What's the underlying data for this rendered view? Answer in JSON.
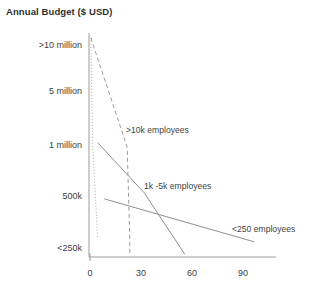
{
  "chart_data": {
    "type": "line",
    "title": "Annual Budget ($ USD)",
    "xlabel": "",
    "ylabel": "Annual Budget ($ USD)",
    "grid": false,
    "legend_position": "inline-annotations",
    "x_ticks": [
      {
        "label": "0",
        "value": 0
      },
      {
        "label": "30",
        "value": 30
      },
      {
        "label": "60",
        "value": 60
      },
      {
        "label": "90",
        "value": 90
      }
    ],
    "xlim": [
      0,
      110
    ],
    "y_ticks": [
      {
        "label": ">10 million",
        "value": 5
      },
      {
        "label": "5 million",
        "value": 4
      },
      {
        "label": "1 million",
        "value": 3
      },
      {
        "label": "500k",
        "value": 2
      },
      {
        "label": "<250k",
        "value": 1
      }
    ],
    "ylim": [
      0.6,
      5.3
    ],
    "series": [
      {
        "name": "more-than-10k-left",
        "label": "",
        "style": "dotted",
        "color": "#a6a6a6",
        "points": [
          [
            0.5,
            5.2
          ],
          [
            1.5,
            3.0
          ],
          [
            4.5,
            1.0
          ]
        ]
      },
      {
        "name": ">10k employees",
        "label": ">10k employees",
        "style": "dashed",
        "color": "#9a9a9a",
        "points": [
          [
            0.5,
            5.2
          ],
          [
            22.0,
            2.9
          ],
          [
            23.5,
            1.0
          ],
          [
            23.5,
            0.62
          ]
        ]
      },
      {
        "name": "1k -5k employees",
        "label": "1k -5k employees",
        "style": "solid",
        "color": "#8f8f8f",
        "points": [
          [
            4.5,
            3.0
          ],
          [
            32.0,
            1.95
          ],
          [
            56.0,
            0.66
          ]
        ]
      },
      {
        "name": "<250 employees",
        "label": "<250 employees",
        "style": "solid",
        "color": "#8f8f8f",
        "points": [
          [
            8.5,
            1.82
          ],
          [
            97.0,
            0.92
          ]
        ]
      }
    ],
    "annotations": [
      {
        "text": ">10k employees",
        "x": 126,
        "y": 125
      },
      {
        "text": "1k -5k employees",
        "x": 144,
        "y": 181
      },
      {
        "text": "<250 employees",
        "x": 232,
        "y": 224
      }
    ]
  }
}
